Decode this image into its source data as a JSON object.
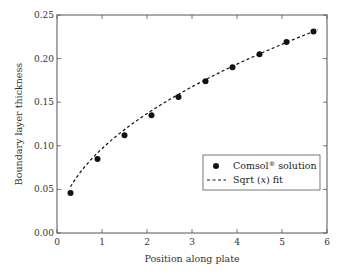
{
  "chart_data": {
    "type": "scatter",
    "title": "",
    "xlabel": "Position along plate",
    "ylabel": "Boundary layer thickness",
    "xlim": [
      0,
      6
    ],
    "ylim": [
      0,
      0.25
    ],
    "xticks": [
      0,
      1,
      2,
      3,
      4,
      5,
      6
    ],
    "xtick_labels": [
      "0",
      "1",
      "2",
      "3",
      "4",
      "5",
      "6"
    ],
    "yticks": [
      0,
      0.05,
      0.1,
      0.15,
      0.2,
      0.25
    ],
    "ytick_labels": [
      "0.00",
      "0.05",
      "0.10",
      "0.15",
      "0.20",
      "0.25"
    ],
    "grid": false,
    "legend_position": "center-right",
    "series": [
      {
        "name": "Comsol® solution",
        "style": "markers",
        "color": "#111111",
        "x": [
          0.3,
          0.9,
          1.5,
          2.1,
          2.7,
          3.3,
          3.9,
          4.5,
          5.1,
          5.7
        ],
        "y": [
          0.046,
          0.085,
          0.112,
          0.135,
          0.156,
          0.174,
          0.19,
          0.205,
          0.219,
          0.231
        ]
      },
      {
        "name": "Sqrt (x) fit",
        "style": "dashed-line",
        "color": "#111111",
        "function": "y = 0.0968 * sqrt(x)",
        "x_range": [
          0.3,
          5.8
        ]
      }
    ],
    "legend": {
      "entries": [
        {
          "label_main": "Comsol",
          "label_sup": "®",
          "label_rest": " solution",
          "marker": "filled-circle"
        },
        {
          "label_main": "Sqrt (",
          "label_italic": "x",
          "label_rest": ") fit",
          "marker": "dashed-line"
        }
      ]
    }
  }
}
